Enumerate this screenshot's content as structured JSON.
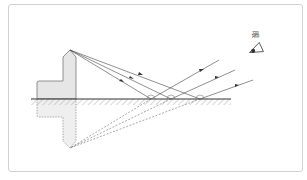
{
  "figure": {
    "caption": "",
    "eye_label": "眼",
    "colors": {
      "frame": "#d2d2d2",
      "ray": "#444444",
      "object_fill": "#e6e6e6",
      "object_stroke": "#777777",
      "mirror": "#333333",
      "hatch": "#999999"
    },
    "mirror": {
      "x1": 31,
      "x2": 231,
      "y": 99
    },
    "object_tip": {
      "x": 70,
      "y": 50
    },
    "image_tip": {
      "x": 70,
      "y": 148
    },
    "reflection_points": [
      {
        "x": 151,
        "y": 99
      },
      {
        "x": 171,
        "y": 99
      },
      {
        "x": 200,
        "y": 99
      }
    ],
    "reflected_ray_ends": [
      {
        "x": 219,
        "y": 60
      },
      {
        "x": 235,
        "y": 70
      },
      {
        "x": 253,
        "y": 80
      }
    ],
    "eye": {
      "x": 255,
      "y": 50
    }
  }
}
